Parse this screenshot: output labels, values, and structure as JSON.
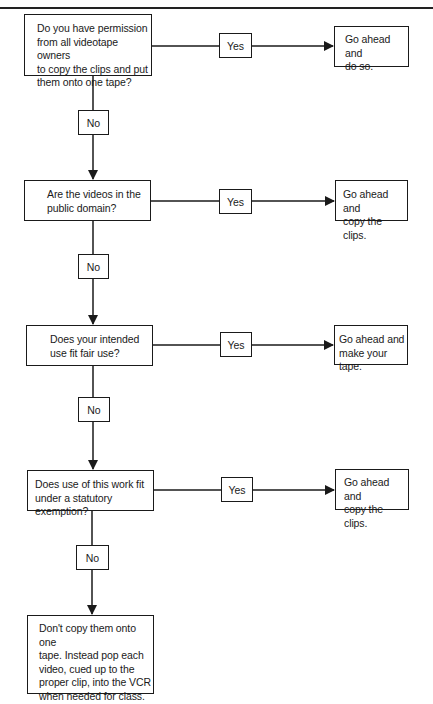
{
  "diagram": {
    "type": "flowchart",
    "title_partially_visible": true,
    "decisions": [
      {
        "question": "Do you have permission\nfrom all videotape owners\nto copy the clips and put\nthem onto one tape?",
        "yes_label": "Yes",
        "yes_outcome": "Go ahead and\ndo so.",
        "no_label": "No"
      },
      {
        "question": "Are the videos in the\npublic domain?",
        "yes_label": "Yes",
        "yes_outcome": "Go ahead and\ncopy the clips.",
        "no_label": "No"
      },
      {
        "question": "Does your intended\nuse fit fair use?",
        "yes_label": "Yes",
        "yes_outcome": "Go ahead and\nmake your tape.",
        "no_label": "No"
      },
      {
        "question": "Does use of this work fit\nunder a statutory exemption?",
        "yes_label": "Yes",
        "yes_outcome": "Go ahead and\ncopy the clips.",
        "no_label": "No"
      }
    ],
    "final_outcome": "Don't copy them onto one\ntape. Instead pop each\nvideo, cued up to the\nproper clip, into the VCR\nwhen needed for class.",
    "colors": {
      "stroke": "#1a1a1a",
      "background": "#ffffff"
    }
  }
}
